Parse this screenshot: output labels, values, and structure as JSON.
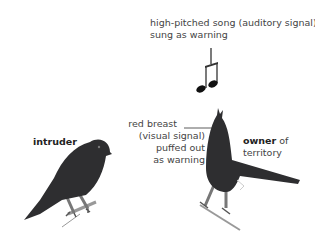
{
  "labels": {
    "song": "high-pitched song (auditory signal) sung as warning",
    "breast_line1": "red breast",
    "breast_line2": "(visual signal)",
    "breast_line3": "puffed out",
    "breast_line4": "as warning",
    "intruder": "intruder",
    "owner_bold": "owner",
    "owner_rest": " of",
    "owner_line2": "territory"
  },
  "icons": {
    "music_note": "beamed-eighth-notes",
    "intruder_bird": "robin-silhouette",
    "owner_bird": "singing-robin-silhouette"
  },
  "colors": {
    "bird_body": "#2e2e30",
    "legs": "#777777",
    "text": "#444444"
  }
}
